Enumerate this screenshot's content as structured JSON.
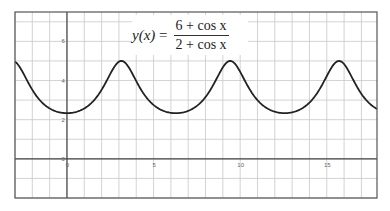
{
  "chart_data": {
    "type": "line",
    "formula": {
      "lhs": "y(x)",
      "equals": "=",
      "numerator": "6 + cos x",
      "denominator": "2 + cos x"
    },
    "xlabel": "",
    "ylabel": "",
    "xlim": [
      -3,
      17.9
    ],
    "ylim": [
      -2,
      7.5
    ],
    "x_ticks": [
      0,
      5,
      10,
      15
    ],
    "x_tick_labels": [
      "0",
      "5",
      "10",
      "15"
    ],
    "y_ticks": [
      0,
      2,
      4,
      6
    ],
    "y_tick_labels": [
      "0",
      "2",
      "4",
      "6"
    ],
    "grid": true,
    "grid_step_x": 1,
    "grid_step_y": 1,
    "series": [
      {
        "name": "y(x) = (6 + cos x)/(2 + cos x)",
        "function": "(6+cos(x))/(2+cos(x))",
        "x_start": -3,
        "x_end": 17.9,
        "samples": 400,
        "color": "#222222",
        "key_points": [
          {
            "x": 0,
            "y": 2.333,
            "note": "minimum"
          },
          {
            "x": 3.1416,
            "y": 5,
            "note": "maximum"
          },
          {
            "x": 6.2832,
            "y": 2.333,
            "note": "minimum"
          },
          {
            "x": 9.4248,
            "y": 5,
            "note": "maximum"
          },
          {
            "x": 12.5664,
            "y": 2.333,
            "note": "minimum"
          },
          {
            "x": 15.708,
            "y": 5,
            "note": "maximum"
          }
        ]
      }
    ],
    "legend": "none"
  },
  "colors": {
    "grid": "#c8c8c8",
    "axis": "#444444",
    "frame": "#555555",
    "curve": "#222222"
  }
}
